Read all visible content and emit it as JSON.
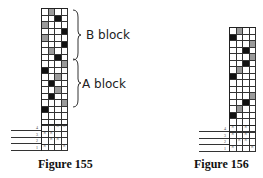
{
  "figures": [
    {
      "caption": "Figure 155",
      "blocks": [
        {
          "label": "B block"
        },
        {
          "label": "A block"
        }
      ],
      "grid": {
        "columns": 4,
        "rows": [
          "-g--",
          "--b-",
          "g---",
          "---b",
          "g---",
          "---b",
          "-g--",
          "--b-",
          "---g",
          "b---",
          "--g-",
          "-b--",
          "--g-",
          "-b--",
          "---g",
          "b---",
          "----",
          "----"
        ]
      },
      "tie_up": {
        "treadles_labels": [
          "4",
          "3",
          "2",
          "1"
        ],
        "rows": [
          "--xx",
          "xx--",
          "-xx-",
          "x--x"
        ]
      }
    },
    {
      "caption": "Figure 156",
      "grid": {
        "columns": 4,
        "rows": [
          "-g--",
          "b---",
          "---g",
          "--b-",
          "---g",
          "--b-",
          "-g--",
          "b---",
          "----",
          "----",
          "---g",
          "--b-",
          "-g--",
          "b---",
          "----",
          "----"
        ]
      },
      "tie_up": {
        "treadles_labels": [
          "4",
          "3",
          "2",
          "1"
        ],
        "rows": [
          "x-x-",
          "x-x-",
          "-xx-",
          "x--x"
        ]
      }
    }
  ]
}
